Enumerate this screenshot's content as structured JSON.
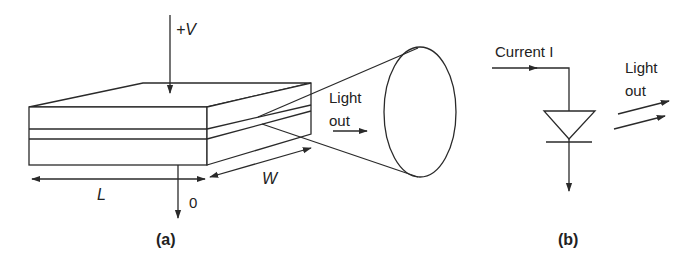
{
  "figure_a": {
    "voltage_label": "+V",
    "ground_label": "0",
    "length_label": "L",
    "width_label": "W",
    "light_label_line1": "Light",
    "light_label_line2": "out",
    "caption": "(a)"
  },
  "figure_b": {
    "current_label": "Current I",
    "light_label_line1": "Light",
    "light_label_line2": "out",
    "caption": "(b)"
  },
  "colors": {
    "stroke": "#2a2a2a",
    "background": "#ffffff"
  }
}
